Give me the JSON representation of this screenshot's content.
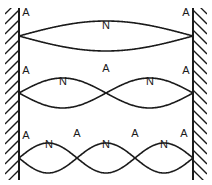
{
  "figure": {
    "width": 212,
    "height": 185,
    "background_color": "#ffffff",
    "line_color": "#1a1a1a",
    "label_color": "#1a1a1a"
  },
  "walls": {
    "left": {
      "label": "left-wall",
      "x": 19,
      "top": 8,
      "bottom": 180,
      "hatch_direction": "lower-left-to-upper-right"
    },
    "right": {
      "label": "right-wall",
      "x": 193,
      "top": 8,
      "bottom": 180,
      "hatch_direction": "lower-right-to-upper-left"
    }
  },
  "chart_data": {
    "type": "line",
    "xlabel": "",
    "ylabel": "",
    "xlim": [
      19,
      193
    ],
    "grid": false,
    "legend": "none",
    "series": [
      {
        "name": "Fundamental (1st harmonic)",
        "nodes": 1,
        "antinodes": 2,
        "loops": 1,
        "baseline_y": 36,
        "amplitude": 15,
        "x_start": 19,
        "x_end": 193
      },
      {
        "name": "Second harmonic",
        "nodes": 2,
        "antinodes": 3,
        "loops": 2,
        "baseline_y": 93,
        "amplitude": 15,
        "x_start": 19,
        "x_end": 193
      },
      {
        "name": "Third harmonic",
        "nodes": 3,
        "antinodes": 4,
        "loops": 3,
        "baseline_y": 158,
        "amplitude": 15,
        "x_start": 19,
        "x_end": 193
      }
    ]
  },
  "labels": {
    "antinode_symbol": "A",
    "node_symbol": "N",
    "row1": [
      {
        "text": "A",
        "x": 26,
        "y": 13,
        "kind": "antinode"
      },
      {
        "text": "N",
        "x": 106,
        "y": 26,
        "kind": "node"
      },
      {
        "text": "A",
        "x": 186,
        "y": 13,
        "kind": "antinode"
      }
    ],
    "row2": [
      {
        "text": "A",
        "x": 26,
        "y": 71,
        "kind": "antinode"
      },
      {
        "text": "N",
        "x": 63,
        "y": 82,
        "kind": "node"
      },
      {
        "text": "A",
        "x": 106,
        "y": 69,
        "kind": "antinode"
      },
      {
        "text": "N",
        "x": 150,
        "y": 82,
        "kind": "node"
      },
      {
        "text": "A",
        "x": 186,
        "y": 71,
        "kind": "antinode"
      }
    ],
    "row3": [
      {
        "text": "A",
        "x": 26,
        "y": 136,
        "kind": "antinode"
      },
      {
        "text": "N",
        "x": 49,
        "y": 145,
        "kind": "node"
      },
      {
        "text": "A",
        "x": 77,
        "y": 134,
        "kind": "antinode"
      },
      {
        "text": "N",
        "x": 106,
        "y": 145,
        "kind": "node"
      },
      {
        "text": "A",
        "x": 135,
        "y": 134,
        "kind": "antinode"
      },
      {
        "text": "N",
        "x": 164,
        "y": 145,
        "kind": "node"
      },
      {
        "text": "A",
        "x": 184,
        "y": 134,
        "kind": "antinode"
      }
    ]
  }
}
